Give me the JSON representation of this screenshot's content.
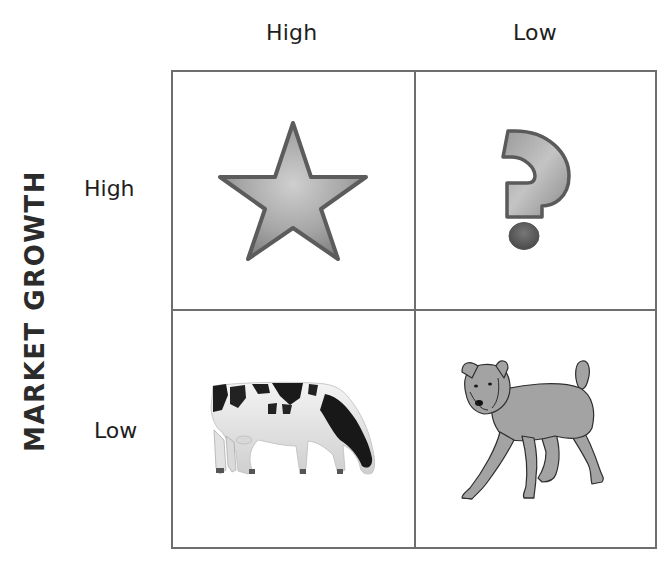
{
  "matrix": {
    "column_labels": [
      "High",
      "Low"
    ],
    "row_labels": [
      "High",
      "Low"
    ],
    "row_axis_title": "MARKET GROWTH",
    "quadrants": [
      {
        "row": "High",
        "col": "High",
        "icon": "star-icon"
      },
      {
        "row": "High",
        "col": "Low",
        "icon": "question-mark-icon"
      },
      {
        "row": "Low",
        "col": "High",
        "icon": "cow-icon"
      },
      {
        "row": "Low",
        "col": "Low",
        "icon": "dog-icon"
      }
    ]
  },
  "colors": {
    "grid_line": "#6e6e6e",
    "icon_fill_light": "#c8c8c8",
    "icon_fill_dark": "#7a7a7a",
    "icon_stroke": "#5a5a5a",
    "text": "#1e1e1e"
  }
}
